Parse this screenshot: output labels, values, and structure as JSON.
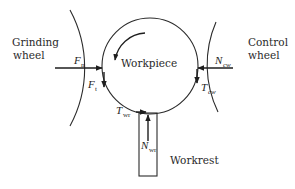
{
  "diagram": {
    "colors": {
      "stroke": "#2b2b2b",
      "background": "#ffffff"
    },
    "labels": {
      "grinding_wheel_line1": "Grinding",
      "grinding_wheel_line2": "wheel",
      "control_wheel_line1": "Control",
      "control_wheel_line2": "wheel",
      "workpiece": "Workpiece",
      "workrest": "Workrest"
    },
    "forces": {
      "fn": {
        "symbol": "F",
        "subscript": "n"
      },
      "ft": {
        "symbol": "F",
        "subscript": "t"
      },
      "ncw": {
        "symbol": "N",
        "subscript": "cw"
      },
      "tcw": {
        "symbol": "T",
        "subscript": "cw"
      },
      "twr": {
        "symbol": "T",
        "subscript": "wr"
      },
      "nwr": {
        "symbol": "N",
        "subscript": "wr"
      }
    }
  }
}
